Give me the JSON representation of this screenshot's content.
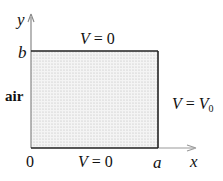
{
  "figure": {
    "axes": {
      "x_label": "x",
      "y_label": "y",
      "origin_label": "0",
      "x_tick_label": "a",
      "y_tick_label": "b"
    },
    "region": {
      "label": "air",
      "fill": "dotted",
      "fill_color": "#d9d9d9",
      "edge_color": "#222222"
    },
    "boundaries": {
      "top": {
        "lhs": "V",
        "eq": "=",
        "rhs": "0"
      },
      "bottom": {
        "lhs": "V",
        "eq": "=",
        "rhs": "0"
      },
      "right": {
        "lhs": "V",
        "eq": "=",
        "rhs_base": "V",
        "rhs_sub": "0"
      }
    },
    "colors": {
      "axis_arrow": "#888888",
      "boundary": "#222222",
      "text": "#111111"
    }
  }
}
